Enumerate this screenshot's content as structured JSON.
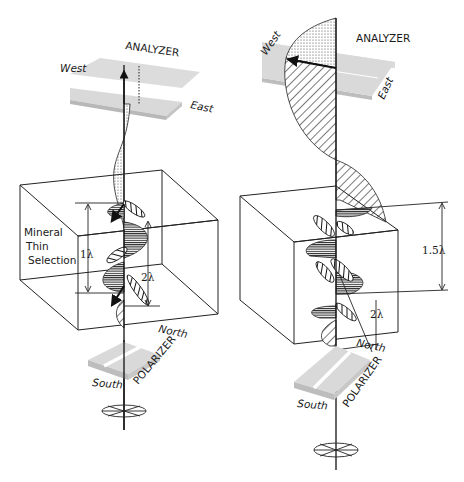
{
  "diagram": {
    "left_panel": {
      "analyzer_label": "ANALYZER",
      "west_label": "West",
      "east_label": "East",
      "box_label_line1": "Mineral",
      "box_label_line2": "Thin",
      "box_label_line3": "Selection",
      "retardation_label": "1λ",
      "thickness_label": "2λ",
      "north_label": "North",
      "south_label": "South",
      "polarizer_label": "POLARIZER"
    },
    "right_panel": {
      "analyzer_label": "ANALYZER",
      "west_label": "West",
      "east_label": "East",
      "retardation_label": "1.5λ",
      "thickness_label": "2λ",
      "north_label": "North",
      "south_label": "South",
      "polarizer_label": "POLARIZER"
    },
    "colors": {
      "plate": "#d9d9d9",
      "plate_side": "#bdbdbd",
      "line": "#1a1a1a",
      "background": "#ffffff"
    }
  }
}
